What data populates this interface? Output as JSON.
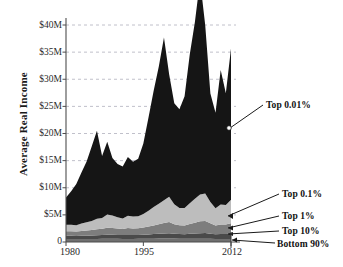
{
  "chart_data": {
    "type": "area",
    "title": "",
    "xlabel": "",
    "ylabel": "Average Real Income",
    "xlim": [
      1980,
      2012
    ],
    "ylim": [
      0,
      42
    ],
    "grid": true,
    "grid_axis": "y",
    "legend_position": "right-annotations",
    "value_unit": "millions of dollars",
    "stacked": true,
    "x": [
      1980,
      1981,
      1982,
      1983,
      1984,
      1985,
      1986,
      1987,
      1988,
      1989,
      1990,
      1991,
      1992,
      1993,
      1994,
      1995,
      1996,
      1997,
      1998,
      1999,
      2000,
      2001,
      2002,
      2003,
      2004,
      2005,
      2006,
      2007,
      2008,
      2009,
      2010,
      2011,
      2012
    ],
    "xticks": [
      1980,
      1995,
      2012
    ],
    "xtick_labels": [
      "1980",
      "1995",
      "2012"
    ],
    "yticks": [
      0,
      5,
      10,
      15,
      20,
      25,
      30,
      35,
      40
    ],
    "ytick_labels": [
      "0",
      "$5M",
      "$10M",
      "$15M",
      "$20M",
      "$25M",
      "$30M",
      "$35M",
      "$40M"
    ],
    "series": [
      {
        "name": "Bottom 90%",
        "color": "#6f6f6f",
        "values": [
          0.55,
          0.55,
          0.54,
          0.54,
          0.55,
          0.56,
          0.57,
          0.58,
          0.58,
          0.59,
          0.58,
          0.57,
          0.57,
          0.57,
          0.58,
          0.59,
          0.6,
          0.61,
          0.63,
          0.64,
          0.65,
          0.63,
          0.62,
          0.61,
          0.61,
          0.61,
          0.62,
          0.62,
          0.6,
          0.57,
          0.57,
          0.57,
          0.57
        ]
      },
      {
        "name": "Top 10%",
        "color": "#4a4a4a",
        "values": [
          0.6,
          0.6,
          0.58,
          0.6,
          0.62,
          0.64,
          0.68,
          0.7,
          0.74,
          0.74,
          0.72,
          0.7,
          0.74,
          0.72,
          0.73,
          0.76,
          0.8,
          0.85,
          0.9,
          0.94,
          0.98,
          0.9,
          0.85,
          0.84,
          0.9,
          0.95,
          1.0,
          1.02,
          0.94,
          0.86,
          0.9,
          0.9,
          0.95
        ]
      },
      {
        "name": "Top 1%",
        "color": "#7d7d7d",
        "values": [
          0.85,
          0.84,
          0.83,
          0.9,
          0.95,
          1.0,
          1.1,
          1.15,
          1.3,
          1.25,
          1.18,
          1.12,
          1.25,
          1.2,
          1.22,
          1.32,
          1.45,
          1.6,
          1.75,
          1.9,
          2.05,
          1.75,
          1.6,
          1.6,
          1.8,
          2.0,
          2.2,
          2.25,
          1.9,
          1.6,
          1.75,
          1.75,
          1.95
        ]
      },
      {
        "name": "Top 0.1%",
        "color": "#bdbdbd",
        "values": [
          1.2,
          1.18,
          1.15,
          1.35,
          1.5,
          1.65,
          1.95,
          2.0,
          2.45,
          2.3,
          2.1,
          1.95,
          2.3,
          2.2,
          2.2,
          2.5,
          2.9,
          3.4,
          3.75,
          4.2,
          4.65,
          3.7,
          3.2,
          3.2,
          3.85,
          4.4,
          4.95,
          5.05,
          3.95,
          3.2,
          3.7,
          3.6,
          4.3
        ]
      },
      {
        "name": "Top 0.01%",
        "color": "#151515",
        "values": [
          5.0,
          6.2,
          7.6,
          9.4,
          11.2,
          13.8,
          16.2,
          11.4,
          13.4,
          10.6,
          9.8,
          9.6,
          10.8,
          10.1,
          10.6,
          13.0,
          17.2,
          21.4,
          25.3,
          30.0,
          22.6,
          18.6,
          18.2,
          20.6,
          27.4,
          32.6,
          39.5,
          31.0,
          20.0,
          17.6,
          24.8,
          20.6,
          27.9
        ]
      }
    ],
    "annotations": [
      {
        "id": "top001",
        "label": "Top 0.01%",
        "series": "Top 0.01%"
      },
      {
        "id": "top01",
        "label": "Top 0.1%",
        "series": "Top 0.1%"
      },
      {
        "id": "top1",
        "label": "Top 1%",
        "series": "Top 1%"
      },
      {
        "id": "top10",
        "label": "Top 10%",
        "series": "Top 10%"
      },
      {
        "id": "bottom90",
        "label": "Bottom 90%",
        "series": "Bottom 90%"
      }
    ]
  },
  "axes": {
    "y_axis_title": "Average Real Income",
    "y_tick_labels": [
      "$40M",
      "$35M",
      "$30M",
      "$25M",
      "$20M",
      "$15M",
      "$10M",
      "$5M",
      "0"
    ],
    "x_tick_labels": [
      "1980",
      "1995",
      "2012"
    ]
  },
  "annotations": {
    "top001": "Top 0.01%",
    "top01": "Top 0.1%",
    "top1": "Top 1%",
    "top10": "Top 10%",
    "bottom90": "Bottom 90%"
  },
  "colors": {
    "top001": "#151515",
    "top01": "#bdbdbd",
    "top1": "#7d7d7d",
    "top10": "#4a4a4a",
    "bottom90": "#6f6f6f",
    "grid": "#b9b9c4",
    "axis": "#4d4d4d",
    "background": "#ffffff"
  }
}
